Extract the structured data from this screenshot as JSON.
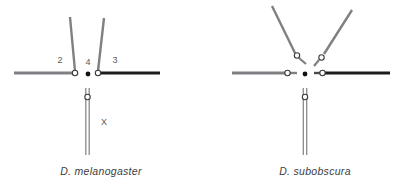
{
  "figure": {
    "type": "diagram",
    "background_color": "#ffffff"
  },
  "colors": {
    "gray_arm": "#808084",
    "black_arm": "#1c1c1c",
    "centromere_dot": "#111111",
    "centromere_ring_stroke": "#3a3a3a",
    "centromere_ring_fill": "#ffffff",
    "x_chromosome": "#8a8a8e",
    "label_text": "#59595c",
    "species_text": "#3d3d40"
  },
  "panels": [
    {
      "id": "melanogaster",
      "species_label": "D. melanogaster",
      "chromosome_labels": [
        {
          "id": "chr2",
          "text": "2"
        },
        {
          "id": "chr4",
          "text": "4"
        },
        {
          "id": "chr3",
          "text": "3"
        },
        {
          "id": "chrX",
          "text": "X"
        }
      ],
      "elements": [
        {
          "name": "chromosome-2-left-arm",
          "color": "gray"
        },
        {
          "name": "chromosome-2-up-arm",
          "color": "gray"
        },
        {
          "name": "chromosome-2-centromere",
          "color": "ring"
        },
        {
          "name": "chromosome-3-right-arm",
          "color": "black"
        },
        {
          "name": "chromosome-3-up-arm",
          "color": "gray"
        },
        {
          "name": "chromosome-3-centromere",
          "color": "ring"
        },
        {
          "name": "chromosome-4-dot",
          "color": "dot"
        },
        {
          "name": "chromosome-x",
          "color": "gray"
        },
        {
          "name": "chromosome-x-centromere",
          "color": "ring"
        }
      ]
    },
    {
      "id": "subobscura",
      "species_label": "D. subobscura",
      "chromosome_labels": [],
      "elements": [
        {
          "name": "arm-upper-left",
          "color": "gray"
        },
        {
          "name": "arm-upper-left-centromere",
          "color": "ring"
        },
        {
          "name": "arm-upper-right",
          "color": "gray"
        },
        {
          "name": "arm-upper-right-centromere",
          "color": "ring"
        },
        {
          "name": "arm-left-horizontal",
          "color": "gray"
        },
        {
          "name": "arm-left-centromere",
          "color": "ring"
        },
        {
          "name": "arm-right-horizontal",
          "color": "black"
        },
        {
          "name": "arm-right-centromere",
          "color": "ring"
        },
        {
          "name": "dot-chromosome",
          "color": "dot"
        },
        {
          "name": "chromosome-x",
          "color": "gray"
        },
        {
          "name": "chromosome-x-centromere",
          "color": "ring"
        }
      ]
    }
  ]
}
